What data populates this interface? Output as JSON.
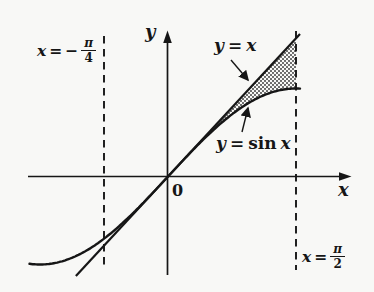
{
  "chart_data": {
    "type": "line",
    "x_axis_label": "x",
    "y_axis_label": "y",
    "origin_label": "0",
    "grid": false,
    "x_range": [
      -1.7,
      1.63
    ],
    "y_range": [
      -1.15,
      1.62
    ],
    "series": [
      {
        "name": "y = x",
        "fn": "x",
        "x_range": [
          -1.13,
          1.62
        ]
      },
      {
        "name": "y = sin x",
        "fn": "sin(x)",
        "x_range": [
          -1.7,
          1.63
        ]
      }
    ],
    "key_points": {
      "x": [
        -1.5708,
        -0.7854,
        0,
        0.7854,
        1.5708
      ],
      "sin_x": [
        -1.0,
        -0.7071,
        0,
        0.7071,
        1.0
      ],
      "y_equals_x": [
        -1.5708,
        -0.7854,
        0,
        0.7854,
        1.5708
      ]
    },
    "boundaries": [
      {
        "label": "x = -π/4",
        "x": -0.7854,
        "style": "dashed"
      },
      {
        "label": "x = π/2",
        "x": 1.5708,
        "style": "dashed"
      }
    ],
    "shaded_region": {
      "between": [
        "y = x",
        "y = sin x"
      ],
      "from_x": 0,
      "to_x": 1.5708,
      "fill": "halftone-gray"
    }
  },
  "labels": {
    "axis_y": "y",
    "axis_x": "x",
    "origin": "0",
    "line": {
      "lhs": "y",
      "eq": "=",
      "rhs": "x"
    },
    "sin": {
      "lhs": "y",
      "eq": "=",
      "func": "sin",
      "arg": "x"
    },
    "left_boundary": {
      "lhs": "x",
      "eq": "=",
      "sign": "−",
      "num": "π",
      "den": "4"
    },
    "right_boundary": {
      "lhs": "x",
      "eq": "=",
      "num": "π",
      "den": "2"
    }
  },
  "style": {
    "ink": "#161616",
    "background": "#f8f8f6",
    "shade_dot": "#4a4a4a"
  }
}
